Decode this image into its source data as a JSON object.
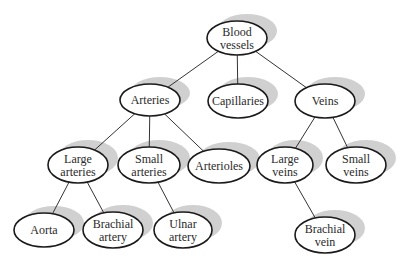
{
  "diagram": {
    "nodes": [
      {
        "id": "blood-vessels",
        "lines": [
          "Blood",
          "vessels"
        ],
        "cx": 237,
        "cy": 38,
        "rx": 30,
        "ry": 17
      },
      {
        "id": "arteries",
        "lines": [
          "Arteries"
        ],
        "cx": 150,
        "cy": 100,
        "rx": 30,
        "ry": 16
      },
      {
        "id": "capillaries",
        "lines": [
          "Capillaries"
        ],
        "cx": 238,
        "cy": 101,
        "rx": 30,
        "ry": 17
      },
      {
        "id": "veins",
        "lines": [
          "Veins"
        ],
        "cx": 325,
        "cy": 101,
        "rx": 30,
        "ry": 17
      },
      {
        "id": "large-arteries",
        "lines": [
          "Large",
          "arteries"
        ],
        "cx": 78,
        "cy": 165,
        "rx": 30,
        "ry": 18
      },
      {
        "id": "small-arteries",
        "lines": [
          "Small",
          "arteries"
        ],
        "cx": 149,
        "cy": 165,
        "rx": 31,
        "ry": 18
      },
      {
        "id": "arterioles",
        "lines": [
          "Arterioles"
        ],
        "cx": 219,
        "cy": 166,
        "rx": 31,
        "ry": 17
      },
      {
        "id": "large-veins",
        "lines": [
          "Large",
          "veins"
        ],
        "cx": 285,
        "cy": 165,
        "rx": 28,
        "ry": 18
      },
      {
        "id": "small-veins",
        "lines": [
          "Small",
          "veins"
        ],
        "cx": 356,
        "cy": 165,
        "rx": 30,
        "ry": 18
      },
      {
        "id": "aorta",
        "lines": [
          "Aorta"
        ],
        "cx": 44,
        "cy": 230,
        "rx": 30,
        "ry": 17
      },
      {
        "id": "brachial-artery",
        "lines": [
          "Brachial",
          "artery"
        ],
        "cx": 113,
        "cy": 230,
        "rx": 30,
        "ry": 18
      },
      {
        "id": "ulnar-artery",
        "lines": [
          "Ulnar",
          "artery"
        ],
        "cx": 183,
        "cy": 230,
        "rx": 29,
        "ry": 18
      },
      {
        "id": "brachial-vein",
        "lines": [
          "Brachial",
          "vein"
        ],
        "cx": 325,
        "cy": 235,
        "rx": 30,
        "ry": 18
      }
    ],
    "edges": [
      [
        "blood-vessels",
        "arteries"
      ],
      [
        "blood-vessels",
        "capillaries"
      ],
      [
        "blood-vessels",
        "veins"
      ],
      [
        "arteries",
        "large-arteries"
      ],
      [
        "arteries",
        "small-arteries"
      ],
      [
        "arteries",
        "arterioles"
      ],
      [
        "veins",
        "large-veins"
      ],
      [
        "veins",
        "small-veins"
      ],
      [
        "large-arteries",
        "aorta"
      ],
      [
        "large-arteries",
        "brachial-artery"
      ],
      [
        "small-arteries",
        "ulnar-artery"
      ],
      [
        "large-veins",
        "brachial-vein"
      ]
    ]
  }
}
